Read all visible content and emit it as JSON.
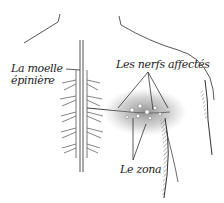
{
  "illustration": {
    "subject": "shingles-nerve-diagram",
    "colors": {
      "ink": "#333333",
      "background": "#ffffff",
      "rash_shade": "#8a8a8a"
    },
    "labels": {
      "spinal_cord_line1": "La moelle",
      "spinal_cord_line2": "épinière",
      "affected_nerves": "Les nerfs affectés",
      "rash": "Le zona"
    }
  }
}
